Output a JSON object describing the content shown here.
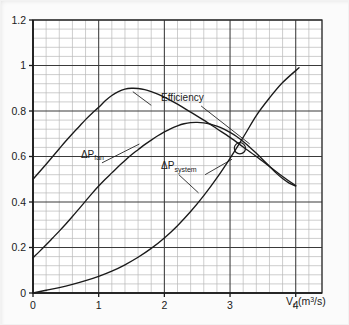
{
  "figure": {
    "background_color": "#fbfbfb",
    "plot_background_color": "#ffffff",
    "ink_color": "#1a1a1a",
    "major_grid_color": "#3a3a3a",
    "minor_grid_color": "#b9b9b9"
  },
  "axis": {
    "x_title_main": "V",
    "x_title_sub": "f",
    "x_title_unit_open": " (m",
    "x_title_unit_sup": "3",
    "x_title_unit_close": "/s)",
    "x_title_full": "Vf (m3/s)",
    "y_title": ""
  },
  "labels": {
    "efficiency": "Efficiency",
    "dp_fan_delta": "ΔP",
    "dp_fan_sub": "fan",
    "dp_system_delta": "ΔP",
    "dp_system_sub": "system",
    "operating_point": "operating-point"
  },
  "chart_data": {
    "type": "line",
    "title": "",
    "xlabel": "Vf (m3/s)",
    "ylabel": "",
    "xlim": [
      0,
      4.4
    ],
    "ylim": [
      0,
      1.2
    ],
    "xticks": [
      0,
      1,
      2,
      3,
      4
    ],
    "xtick_labels": [
      "0",
      "1",
      "2",
      "3",
      "4"
    ],
    "yticks": [
      0,
      0.2,
      0.4,
      0.6,
      0.8,
      1,
      1.2
    ],
    "ytick_labels": [
      "0",
      "0.2",
      "0.4",
      "0.6",
      "0.8",
      "1",
      "1.2"
    ],
    "grid": true,
    "grid_major_x_step": 1,
    "grid_minor_x_step": 0.2,
    "grid_major_y_step": 0.2,
    "grid_minor_y_step": 0.04,
    "legend": "none (curves labelled inline with leader lines)",
    "series": [
      {
        "name": "Efficiency",
        "label_text": "Efficiency",
        "label_x": 1.95,
        "label_y": 0.845,
        "leader_from": [
          1.8,
          0.825
        ],
        "leader_to": [
          1.52,
          0.885
        ],
        "leader2_from": [
          2.56,
          0.822
        ],
        "leader2_to": [
          3.3,
          0.655
        ],
        "points": [
          [
            0.0,
            0.5
          ],
          [
            0.1,
            0.533
          ],
          [
            0.2,
            0.566
          ],
          [
            0.3,
            0.6
          ],
          [
            0.4,
            0.634
          ],
          [
            0.5,
            0.668
          ],
          [
            0.6,
            0.7
          ],
          [
            0.7,
            0.731
          ],
          [
            0.8,
            0.762
          ],
          [
            0.9,
            0.79
          ],
          [
            1.0,
            0.816
          ],
          [
            1.1,
            0.845
          ],
          [
            1.2,
            0.868
          ],
          [
            1.3,
            0.885
          ],
          [
            1.4,
            0.896
          ],
          [
            1.5,
            0.9
          ],
          [
            1.6,
            0.899
          ],
          [
            1.7,
            0.894
          ],
          [
            1.8,
            0.885
          ],
          [
            1.9,
            0.874
          ],
          [
            2.0,
            0.861
          ],
          [
            2.2,
            0.83
          ],
          [
            2.4,
            0.795
          ],
          [
            2.6,
            0.76
          ],
          [
            2.8,
            0.722
          ],
          [
            3.0,
            0.684
          ],
          [
            3.2,
            0.642
          ],
          [
            3.4,
            0.6
          ],
          [
            3.6,
            0.556
          ],
          [
            3.8,
            0.512
          ],
          [
            4.0,
            0.472
          ]
        ]
      },
      {
        "name": "dP_fan",
        "label_text": "ΔPfan",
        "label_x": 0.73,
        "label_y": 0.595,
        "leader_from": [
          1.05,
          0.572
        ],
        "leader_to": [
          1.62,
          0.655
        ],
        "points": [
          [
            0.0,
            0.155
          ],
          [
            0.1,
            0.183
          ],
          [
            0.2,
            0.212
          ],
          [
            0.3,
            0.242
          ],
          [
            0.4,
            0.272
          ],
          [
            0.5,
            0.303
          ],
          [
            0.6,
            0.336
          ],
          [
            0.7,
            0.37
          ],
          [
            0.8,
            0.404
          ],
          [
            0.9,
            0.438
          ],
          [
            1.0,
            0.47
          ],
          [
            1.1,
            0.5
          ],
          [
            1.2,
            0.528
          ],
          [
            1.3,
            0.556
          ],
          [
            1.4,
            0.582
          ],
          [
            1.5,
            0.608
          ],
          [
            1.6,
            0.63
          ],
          [
            1.7,
            0.652
          ],
          [
            1.8,
            0.672
          ],
          [
            1.9,
            0.691
          ],
          [
            2.0,
            0.708
          ],
          [
            2.1,
            0.723
          ],
          [
            2.2,
            0.735
          ],
          [
            2.3,
            0.744
          ],
          [
            2.4,
            0.749
          ],
          [
            2.5,
            0.75
          ],
          [
            2.6,
            0.748
          ],
          [
            2.7,
            0.742
          ],
          [
            2.8,
            0.733
          ],
          [
            2.9,
            0.721
          ],
          [
            3.0,
            0.706
          ],
          [
            3.1,
            0.688
          ],
          [
            3.2,
            0.666
          ],
          [
            3.3,
            0.641
          ],
          [
            3.4,
            0.614
          ],
          [
            3.5,
            0.586
          ],
          [
            3.6,
            0.557
          ],
          [
            3.7,
            0.528
          ],
          [
            3.8,
            0.503
          ],
          [
            3.9,
            0.483
          ],
          [
            4.0,
            0.47
          ]
        ]
      },
      {
        "name": "dP_system",
        "label_text": "ΔPsystem",
        "label_x": 1.95,
        "label_y": 0.545,
        "leader_from": [
          2.22,
          0.52
        ],
        "leader_to": [
          2.52,
          0.44
        ],
        "leader2_from": [
          2.62,
          0.52
        ],
        "leader2_to": [
          3.03,
          0.588
        ],
        "points": [
          [
            0.0,
            0.0
          ],
          [
            0.2,
            0.012
          ],
          [
            0.4,
            0.024
          ],
          [
            0.6,
            0.038
          ],
          [
            0.8,
            0.054
          ],
          [
            1.0,
            0.073
          ],
          [
            1.2,
            0.096
          ],
          [
            1.4,
            0.124
          ],
          [
            1.6,
            0.157
          ],
          [
            1.8,
            0.196
          ],
          [
            2.0,
            0.242
          ],
          [
            2.2,
            0.296
          ],
          [
            2.4,
            0.358
          ],
          [
            2.6,
            0.428
          ],
          [
            2.8,
            0.506
          ],
          [
            3.0,
            0.592
          ],
          [
            3.2,
            0.684
          ],
          [
            3.4,
            0.78
          ],
          [
            3.6,
            0.857
          ],
          [
            3.8,
            0.925
          ],
          [
            4.05,
            0.99
          ]
        ]
      }
    ],
    "annotations": [
      {
        "name": "operating-point",
        "type": "circle-marker",
        "x": 3.15,
        "y": 0.636,
        "note": "intersection of fan curve and system curve"
      }
    ]
  }
}
